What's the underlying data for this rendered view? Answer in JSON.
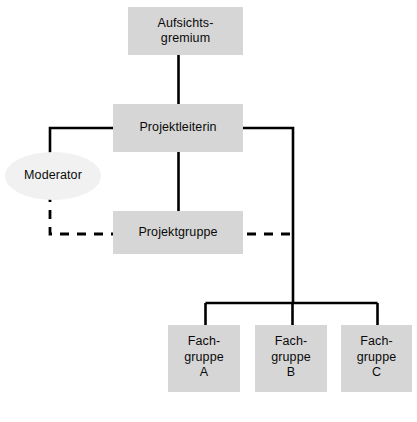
{
  "diagram": {
    "type": "organizational-chart",
    "language": "de",
    "background_color": "#ffffff",
    "box_fill_color": "#d6d6d6",
    "ellipse_fill_color": "#f1f1f1",
    "line_color": "#000000",
    "nodes": [
      {
        "id": "aufsichtsgremium",
        "label": "Aufsichts-\ngremium",
        "shape": "rectangle",
        "x": 128,
        "y": 7,
        "width": 115,
        "height": 48
      },
      {
        "id": "projektleiterin",
        "label": "Projektleiterin",
        "shape": "rectangle",
        "x": 113,
        "y": 104,
        "width": 130,
        "height": 48
      },
      {
        "id": "moderator",
        "label": "Moderator",
        "shape": "ellipse",
        "x": 5,
        "y": 152,
        "width": 96,
        "height": 48
      },
      {
        "id": "projektgruppe",
        "label": "Projektgruppe",
        "shape": "rectangle",
        "x": 113,
        "y": 211,
        "width": 130,
        "height": 43
      },
      {
        "id": "fachgruppe-a",
        "label": "Fach-\ngruppe\nA",
        "shape": "rectangle",
        "x": 168,
        "y": 325,
        "width": 72,
        "height": 67
      },
      {
        "id": "fachgruppe-b",
        "label": "Fach-\ngruppe\nB",
        "shape": "rectangle",
        "x": 255,
        "y": 325,
        "width": 72,
        "height": 67
      },
      {
        "id": "fachgruppe-c",
        "label": "Fach-\ngruppe\nC",
        "shape": "rectangle",
        "x": 341,
        "y": 325,
        "width": 71,
        "height": 67
      }
    ],
    "connectors": [
      {
        "id": "aufsichtsgremium-to-projektleiterin",
        "from": "aufsichtsgremium",
        "to": "projektleiterin",
        "style": "solid"
      },
      {
        "id": "projektleiterin-to-moderator",
        "from": "projektleiterin",
        "to": "moderator",
        "style": "solid"
      },
      {
        "id": "projektleiterin-to-projektgruppe",
        "from": "projektleiterin",
        "to": "projektgruppe",
        "style": "solid"
      },
      {
        "id": "moderator-to-projektgruppe",
        "from": "moderator",
        "to": "projektgruppe",
        "style": "dashed"
      },
      {
        "id": "projektleiterin-to-fachgruppen",
        "from": "projektleiterin",
        "to": "fachgruppe-b",
        "style": "solid"
      },
      {
        "id": "fachgruppen-bus",
        "from": "projektleiterin",
        "to": "fachgruppe-a",
        "style": "solid"
      },
      {
        "id": "fachgruppen-bus-c",
        "from": "projektleiterin",
        "to": "fachgruppe-c",
        "style": "solid"
      }
    ]
  }
}
